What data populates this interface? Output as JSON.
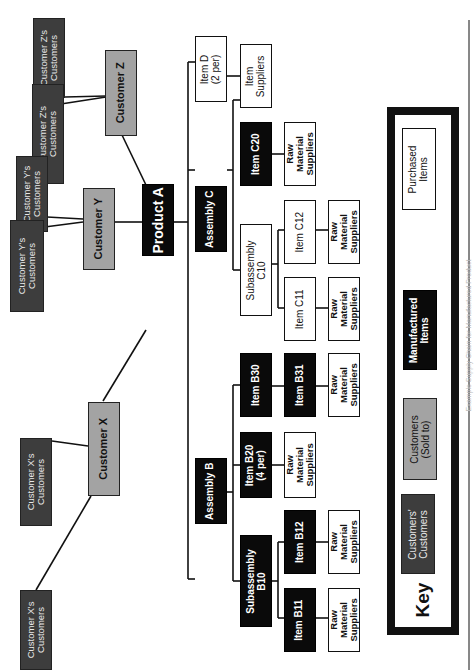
{
  "diagram": {
    "root": "Product A",
    "customers": [
      {
        "label": "Customer X",
        "customers_of": [
          "Customer X's\nCustomers",
          "Customer X's\nCustomers"
        ]
      },
      {
        "label": "Customer Y",
        "customers_of": [
          "Customer Y's\nCustomers",
          "Customer Y's\nCustomers"
        ]
      },
      {
        "label": "Customer Z",
        "customers_of": [
          "Customer Z's\nCustomers",
          "Customer Z's\nCustomers"
        ]
      }
    ],
    "assembly_b": {
      "label": "Assembly B",
      "subassembly_b10": "Subassembly\nB10",
      "item_b11": "Item B11",
      "item_b12": "Item B12",
      "item_b20": "Item B20\n(4 per)",
      "item_b30": "Item B30",
      "item_b31": "Item B31",
      "raw_b11": "Raw\nMaterial\nSuppliers",
      "raw_b12": "Raw\nMaterial\nSuppliers",
      "raw_b20": "Raw\nMaterial\nSuppliers",
      "raw_b31": "Raw\nMaterial\nSuppliers"
    },
    "assembly_c": {
      "label": "Assembly C",
      "subassembly_c10": "Subassembly\nC10",
      "item_c11": "Item C11",
      "item_c12": "Item C12",
      "item_c20": "Item C20",
      "raw_c11": "Raw\nMaterial\nSuppliers",
      "raw_c12": "Raw\nMaterial\nSuppliers",
      "raw_c20": "Raw\nMaterial\nSuppliers"
    },
    "item_d": {
      "label": "Item D\n(2 per)",
      "suppliers": "Item\nSuppliers"
    }
  },
  "key": {
    "title": "Key",
    "entries": [
      {
        "label": "Customers'\nCustomers",
        "color": "#3d3d3d"
      },
      {
        "label": "Customers\n(Sold to)",
        "color": "#a3a3a3"
      },
      {
        "label": "Manufactured\nItems",
        "color": "#0a0a0a"
      },
      {
        "label": "Purchased\nItems",
        "color": "#ffffff"
      }
    ]
  },
  "caption": "Example Supply Chain for Manufactured Product"
}
